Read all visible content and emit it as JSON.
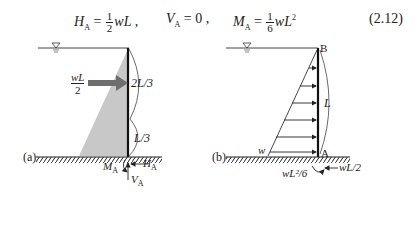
{
  "equation": {
    "H": "H",
    "H_sub": "A",
    "eq1_frac_num": "1",
    "eq1_frac_den": "2",
    "eq1_rest": "wL ,",
    "V": "V",
    "V_sub": "A",
    "eq2_rest": "= 0 ,",
    "M": "M",
    "M_sub": "A",
    "eq3_frac_num": "1",
    "eq3_frac_den": "6",
    "eq3_rest": "wL",
    "eq3_sup": "2",
    "number": "(2.12)"
  },
  "figure_a": {
    "label": "(a)",
    "force_num": "wL",
    "force_den": "2",
    "upper_dim": "2L/3",
    "lower_dim": "L/3",
    "moment": "M",
    "moment_sub": "A",
    "horizontal": "H",
    "horizontal_sub": "A",
    "vertical": "V",
    "vertical_sub": "A",
    "water_symbol": "∇"
  },
  "figure_b": {
    "label": "(b)",
    "top_point": "B",
    "bottom_point": "A",
    "length": "L",
    "load": "w",
    "moment_reaction": "wL²/6",
    "horizontal_reaction": "wL/2",
    "water_symbol": "∇"
  },
  "colors": {
    "load_fill": "#c8c8c8",
    "arrow_fill": "#6e6e6e",
    "ink": "#222222"
  }
}
